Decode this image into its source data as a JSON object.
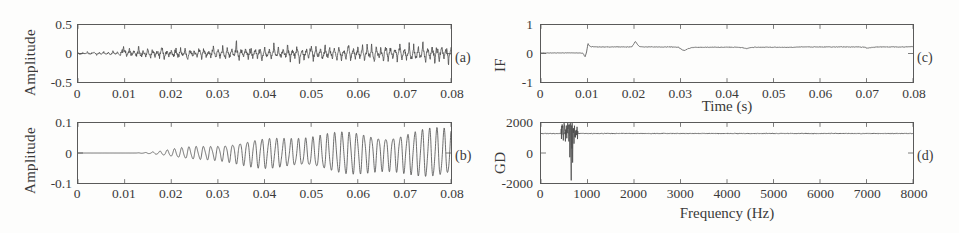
{
  "figure": {
    "background": "#fdfdfc",
    "trace_color": "#4a4a4a",
    "axis_color": "#5a5a5a"
  },
  "chart_data": [
    {
      "type": "line",
      "panel_label": "(a)",
      "title": "",
      "xlabel": "",
      "ylabel": "Amplitude",
      "xlim": [
        0,
        0.08
      ],
      "ylim": [
        -0.5,
        0.5
      ],
      "xticks": [
        0,
        0.01,
        0.02,
        0.03,
        0.04,
        0.05,
        0.06,
        0.07,
        0.08
      ],
      "xticklabels": [
        "0",
        "0.01",
        "0.02",
        "0.03",
        "0.04",
        "0.05",
        "0.06",
        "0.07",
        "0.08"
      ],
      "yticks": [
        -0.5,
        0,
        0.5
      ],
      "yticklabels": [
        "-0.5",
        "0",
        "0.5"
      ],
      "grid": false,
      "legend": "none",
      "description": "Noisy vibration signal; low amplitude noise until about 0.009 s then repeating impulse bursts of amplitude up to about 0.25",
      "x": [
        0,
        0.0005,
        0.001,
        0.0015,
        0.002,
        0.0025,
        0.003,
        0.0035,
        0.004,
        0.0045,
        0.005,
        0.0055,
        0.006,
        0.0065,
        0.007,
        0.0075,
        0.008,
        0.0085,
        0.009,
        0.0095,
        0.01,
        0.0105,
        0.011,
        0.0115,
        0.012,
        0.0125,
        0.013,
        0.0135,
        0.014,
        0.0145,
        0.015,
        0.0155,
        0.016,
        0.0165,
        0.017,
        0.0175,
        0.018,
        0.0185,
        0.019,
        0.0195,
        0.02,
        0.0205,
        0.021,
        0.0215,
        0.022,
        0.0225,
        0.023,
        0.0235,
        0.024,
        0.0245,
        0.025,
        0.0255,
        0.026,
        0.0265,
        0.027,
        0.0275,
        0.028,
        0.0285,
        0.029,
        0.0295,
        0.03,
        0.0305,
        0.031,
        0.0315,
        0.032,
        0.0325,
        0.033,
        0.0335,
        0.034,
        0.0345,
        0.035,
        0.0355,
        0.036,
        0.0365,
        0.037,
        0.0375,
        0.038,
        0.0385,
        0.039,
        0.0395,
        0.04,
        0.0405,
        0.041,
        0.0415,
        0.042,
        0.0425,
        0.043,
        0.0435,
        0.044,
        0.0445,
        0.045,
        0.0455,
        0.046,
        0.0465,
        0.047,
        0.0475,
        0.048,
        0.0485,
        0.049,
        0.0495,
        0.05,
        0.0505,
        0.051,
        0.0515,
        0.052,
        0.0525,
        0.053,
        0.0535,
        0.054,
        0.0545,
        0.055,
        0.0555,
        0.056,
        0.0565,
        0.057,
        0.0575,
        0.058,
        0.0585,
        0.059,
        0.0595,
        0.06,
        0.0605,
        0.061,
        0.0615,
        0.062,
        0.0625,
        0.063,
        0.0635,
        0.064,
        0.0645,
        0.065,
        0.0655,
        0.066,
        0.0665,
        0.067,
        0.0675,
        0.068,
        0.0685,
        0.069,
        0.0695,
        0.07,
        0.0705,
        0.071,
        0.0715,
        0.072,
        0.0725,
        0.073,
        0.0735,
        0.074,
        0.0745,
        0.075,
        0.0755,
        0.076,
        0.0765,
        0.077,
        0.0775,
        0.078,
        0.0785,
        0.079,
        0.0795,
        0.08
      ],
      "y": [
        0.01,
        -0.02,
        0.02,
        -0.01,
        0.03,
        -0.02,
        0.01,
        0.02,
        -0.03,
        0.02,
        -0.01,
        0.03,
        -0.02,
        0.02,
        -0.03,
        0.04,
        -0.02,
        0.03,
        -0.04,
        0.06,
        0.12,
        -0.07,
        0.08,
        -0.05,
        0.04,
        -0.06,
        0.13,
        -0.09,
        0.07,
        -0.05,
        0.09,
        -0.12,
        0.08,
        -0.06,
        0.05,
        -0.07,
        0.14,
        -0.1,
        0.08,
        -0.05,
        0.06,
        -0.08,
        0.12,
        -0.09,
        0.07,
        -0.06,
        0.1,
        -0.13,
        0.09,
        -0.07,
        0.06,
        -0.08,
        0.15,
        -0.11,
        0.09,
        -0.06,
        0.07,
        -0.09,
        0.13,
        -0.1,
        0.08,
        -0.07,
        0.11,
        -0.14,
        0.1,
        -0.08,
        0.07,
        -0.09,
        0.22,
        -0.13,
        0.1,
        -0.07,
        0.08,
        -0.1,
        0.14,
        -0.11,
        0.09,
        -0.08,
        0.12,
        -0.15,
        0.11,
        -0.09,
        0.08,
        -0.1,
        0.16,
        -0.12,
        0.1,
        -0.08,
        0.09,
        -0.11,
        0.15,
        -0.12,
        0.1,
        -0.09,
        0.13,
        -0.16,
        0.12,
        -0.1,
        0.09,
        -0.11,
        0.21,
        -0.14,
        0.11,
        -0.09,
        0.1,
        -0.12,
        0.16,
        -0.13,
        0.11,
        -0.1,
        0.14,
        -0.17,
        0.13,
        -0.11,
        0.1,
        -0.12,
        0.18,
        -0.14,
        0.12,
        -0.1,
        0.11,
        -0.13,
        0.17,
        -0.14,
        0.12,
        -0.11,
        0.15,
        -0.18,
        0.14,
        -0.12,
        0.11,
        -0.13,
        0.2,
        -0.15,
        0.13,
        -0.11,
        0.12,
        -0.14,
        0.18,
        -0.15,
        0.13,
        -0.12,
        0.16,
        -0.19,
        0.15,
        -0.13,
        0.12,
        -0.14,
        0.19,
        -0.16,
        0.14,
        -0.12,
        0.13,
        -0.15,
        0.18,
        -0.15,
        0.13,
        -0.12,
        0.16,
        -0.18,
        0.14,
        -0.12,
        0.11,
        -0.13,
        0.17,
        -0.14,
        0.12,
        -0.1,
        0.09
      ]
    },
    {
      "type": "line",
      "panel_label": "(b)",
      "title": "",
      "xlabel": "",
      "ylabel": "Amplitude",
      "xlim": [
        0,
        0.08
      ],
      "ylim": [
        -0.1,
        0.1
      ],
      "xticks": [
        0,
        0.01,
        0.02,
        0.03,
        0.04,
        0.05,
        0.06,
        0.07,
        0.08
      ],
      "xticklabels": [
        "0",
        "0.01",
        "0.02",
        "0.03",
        "0.04",
        "0.05",
        "0.06",
        "0.07",
        "0.08"
      ],
      "yticks": [
        -0.1,
        0,
        0.1
      ],
      "yticklabels": [
        "-0.1",
        "0",
        "0.1"
      ],
      "grid": false,
      "legend": "none",
      "description": "Extracted mono-component: essentially zero until about 0.013 s, then an oscillation whose envelope grows steadily to about 0.07 by 0.08 s",
      "envelope": [
        0,
        0,
        0,
        0,
        0.002,
        0.006,
        0.012,
        0.02,
        0.028,
        0.035,
        0.042,
        0.05,
        0.056,
        0.06,
        0.064,
        0.067,
        0.07
      ],
      "envelope_t": [
        0,
        0.005,
        0.009,
        0.012,
        0.015,
        0.018,
        0.021,
        0.025,
        0.03,
        0.035,
        0.04,
        0.047,
        0.053,
        0.06,
        0.067,
        0.074,
        0.08
      ],
      "carrier_hz": 640
    },
    {
      "type": "line",
      "panel_label": "(c)",
      "title": "",
      "xlabel": "Time (s)",
      "ylabel": "IF",
      "xlim": [
        0,
        0.08
      ],
      "ylim": [
        -1,
        1
      ],
      "xticks": [
        0,
        0.01,
        0.02,
        0.03,
        0.04,
        0.05,
        0.06,
        0.07,
        0.08
      ],
      "xticklabels": [
        "0",
        "0.01",
        "0.02",
        "0.03",
        "0.04",
        "0.05",
        "0.06",
        "0.07",
        "0.08"
      ],
      "yticks": [
        -1,
        0,
        1
      ],
      "yticklabels": [
        "-1",
        "0",
        "1"
      ],
      "grid": false,
      "legend": "none",
      "description": "Instantaneous frequency: flat near 0.02 until 0.009 s, brief dip to -0.12, spike to 0.35 at 0.010, settles near 0.22 with a spike to 0.42 at 0.021 and a dip to 0.10 at 0.030",
      "x": [
        0,
        0.002,
        0.004,
        0.006,
        0.0075,
        0.0085,
        0.009,
        0.0092,
        0.0095,
        0.0098,
        0.0101,
        0.0104,
        0.0108,
        0.0112,
        0.012,
        0.013,
        0.014,
        0.016,
        0.018,
        0.0195,
        0.0203,
        0.0208,
        0.0212,
        0.0218,
        0.0225,
        0.024,
        0.026,
        0.028,
        0.0295,
        0.0302,
        0.0308,
        0.0315,
        0.0325,
        0.034,
        0.036,
        0.038,
        0.04,
        0.042,
        0.0435,
        0.0442,
        0.045,
        0.046,
        0.048,
        0.05,
        0.052,
        0.054,
        0.056,
        0.058,
        0.06,
        0.062,
        0.064,
        0.066,
        0.068,
        0.0695,
        0.0702,
        0.071,
        0.072,
        0.074,
        0.076,
        0.078,
        0.08
      ],
      "y": [
        0.02,
        0.02,
        0.02,
        0.02,
        0.02,
        0.02,
        0.01,
        -0.04,
        -0.12,
        0.05,
        0.35,
        0.27,
        0.23,
        0.24,
        0.23,
        0.23,
        0.23,
        0.23,
        0.23,
        0.23,
        0.42,
        0.3,
        0.24,
        0.23,
        0.23,
        0.23,
        0.23,
        0.23,
        0.22,
        0.15,
        0.1,
        0.16,
        0.21,
        0.22,
        0.22,
        0.22,
        0.22,
        0.22,
        0.2,
        0.17,
        0.2,
        0.22,
        0.22,
        0.22,
        0.22,
        0.22,
        0.23,
        0.23,
        0.23,
        0.23,
        0.23,
        0.23,
        0.23,
        0.22,
        0.19,
        0.21,
        0.23,
        0.23,
        0.23,
        0.23,
        0.24
      ]
    },
    {
      "type": "line",
      "panel_label": "(d)",
      "title": "",
      "xlabel": "Frequency (Hz)",
      "ylabel": "GD",
      "xlim": [
        0,
        8000
      ],
      "ylim": [
        -2000,
        2000
      ],
      "xticks": [
        0,
        1000,
        2000,
        3000,
        4000,
        5000,
        6000,
        7000,
        8000
      ],
      "xticklabels": [
        "0",
        "1000",
        "2000",
        "3000",
        "4000",
        "5000",
        "6000",
        "7000",
        "8000"
      ],
      "yticks": [
        -2000,
        0,
        2000
      ],
      "yticklabels": [
        "-2000",
        "0",
        "2000"
      ],
      "grid": false,
      "legend": "none",
      "description": "Group delay: constant near 1300 across the band except a cluster of sharp spikes between about 450 and 780 Hz reaching 2000 and dipping to about -1400",
      "x": [
        0,
        200,
        380,
        440,
        460,
        480,
        500,
        520,
        540,
        560,
        580,
        600,
        610,
        620,
        630,
        640,
        650,
        660,
        665,
        670,
        680,
        690,
        700,
        710,
        720,
        730,
        740,
        750,
        760,
        780,
        900,
        1200,
        2000,
        3000,
        4000,
        5000,
        6000,
        7000,
        8000
      ],
      "y": [
        1300,
        1300,
        1300,
        1300,
        1850,
        1150,
        1900,
        1000,
        1750,
        1300,
        1950,
        900,
        1700,
        -300,
        2000,
        600,
        -1400,
        1500,
        200,
        1850,
        -700,
        1300,
        1600,
        500,
        1400,
        1000,
        1350,
        1250,
        1300,
        1300,
        1300,
        1300,
        1300,
        1300,
        1300,
        1300,
        1300,
        1300,
        1300
      ]
    }
  ]
}
